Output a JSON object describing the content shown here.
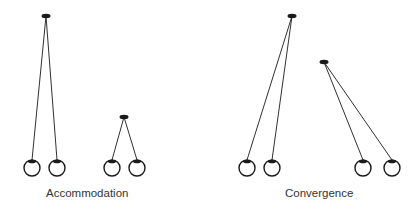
{
  "panels": [
    {
      "label": "Accommodation",
      "targets": [
        {
          "x": 46,
          "y": 16,
          "eyes": [
            {
              "x": 32,
              "y": 168
            },
            {
              "x": 57,
              "y": 168
            }
          ]
        },
        {
          "x": 124,
          "y": 117,
          "eyes": [
            {
              "x": 112,
              "y": 168
            },
            {
              "x": 137,
              "y": 168
            }
          ]
        }
      ]
    },
    {
      "label": "Convergence",
      "targets": [
        {
          "x": 292,
          "y": 16,
          "eyes": [
            {
              "x": 247,
              "y": 168
            },
            {
              "x": 272,
              "y": 168
            }
          ]
        },
        {
          "x": 324,
          "y": 62,
          "eyes": [
            {
              "x": 363,
              "y": 168
            },
            {
              "x": 392,
              "y": 168
            }
          ]
        }
      ]
    }
  ],
  "colors": {
    "stroke": "#1a1a1a",
    "text": "#333333"
  }
}
